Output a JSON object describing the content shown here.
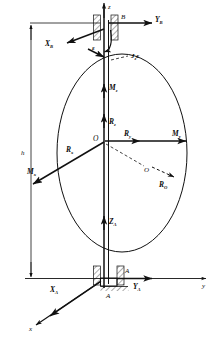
{
  "figure": {
    "type": "free-body-diagram",
    "background_color": "#ffffff",
    "line_color": "#111111",
    "width": 216,
    "height": 341
  },
  "axes": {
    "z_axis_label": "z",
    "y_axis_label": "y",
    "x_axis_label": "x",
    "origin_label": "O",
    "center_of_mass_label": "O"
  },
  "dimensions": {
    "height_label": "h"
  },
  "supports": {
    "upper_bearing_label": "B",
    "lower_bearing_label": "A",
    "lower_bearing_label2": "A"
  },
  "vectors": [
    {
      "id": "YB",
      "label": "Y",
      "subscript": "B",
      "description": "reaction at upper bearing B, along +y"
    },
    {
      "id": "XB",
      "label": "X",
      "subscript": "B",
      "description": "reaction at upper bearing B, along +x"
    },
    {
      "id": "Jze",
      "label": "J",
      "subscript": "z",
      "suffix": "ε",
      "description": "inertia couple J-z epsilon about shaft axis"
    },
    {
      "id": "epsilon",
      "label": "ε",
      "subscript": "",
      "description": "angular acceleration epsilon"
    },
    {
      "id": "Mz",
      "label": "M",
      "subscript": "z",
      "description": "moment about z axis"
    },
    {
      "id": "Rz",
      "label": "R",
      "subscript": "z",
      "description": "resultant force component along z"
    },
    {
      "id": "Ry",
      "label": "R",
      "subscript": "y",
      "description": "resultant force component along y"
    },
    {
      "id": "My",
      "label": "M",
      "subscript": "y",
      "description": "moment about y axis"
    },
    {
      "id": "Rx",
      "label": "R",
      "subscript": "x",
      "description": "resultant force component along x"
    },
    {
      "id": "Mx",
      "label": "M",
      "subscript": "x",
      "description": "moment about x axis"
    },
    {
      "id": "RO",
      "label": "R",
      "subscript": "O",
      "description": "resultant force at mass centre O"
    },
    {
      "id": "ZA",
      "label": "Z",
      "subscript": "A",
      "description": "axial reaction at lower bearing A"
    },
    {
      "id": "XA",
      "label": "X",
      "subscript": "A",
      "description": "reaction at lower bearing A, along +x"
    },
    {
      "id": "YA",
      "label": "Y",
      "subscript": "A",
      "description": "reaction at lower bearing A, along +y"
    }
  ]
}
